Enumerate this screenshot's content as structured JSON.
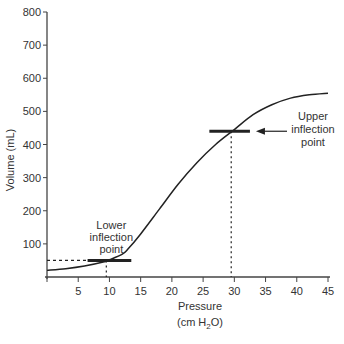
{
  "chart_data": {
    "type": "line",
    "title": "",
    "xlabel": "Pressure",
    "xlabel_units_prefix": "(cm H",
    "xlabel_units_sub": "2",
    "xlabel_units_suffix": "O)",
    "ylabel": "Volume (mL)",
    "xlim": [
      0,
      45
    ],
    "ylim": [
      0,
      800
    ],
    "xticks": [
      5,
      10,
      15,
      20,
      25,
      30,
      35,
      40,
      45
    ],
    "yticks": [
      100,
      200,
      300,
      400,
      500,
      600,
      700,
      800
    ],
    "grid": false,
    "series": [
      {
        "name": "Pressure-volume curve",
        "x": [
          0,
          3,
          6,
          9,
          10,
          12,
          13,
          15,
          18,
          21,
          24,
          27,
          30,
          33,
          36,
          39,
          42,
          45
        ],
        "y": [
          20,
          25,
          33,
          45,
          52,
          68,
          85,
          130,
          205,
          280,
          345,
          400,
          445,
          490,
          520,
          540,
          550,
          555
        ]
      }
    ],
    "annotations": [
      {
        "id": "lower",
        "label_lines": [
          "Lower",
          "inflection",
          "point"
        ],
        "x": 9.5,
        "y": 50,
        "bar_x_range": [
          6.5,
          13.5
        ]
      },
      {
        "id": "upper",
        "label_lines": [
          "Upper",
          "inflection",
          "point"
        ],
        "x": 29.5,
        "y": 440,
        "bar_x_range": [
          26,
          32.5
        ],
        "arrow": true
      }
    ]
  }
}
